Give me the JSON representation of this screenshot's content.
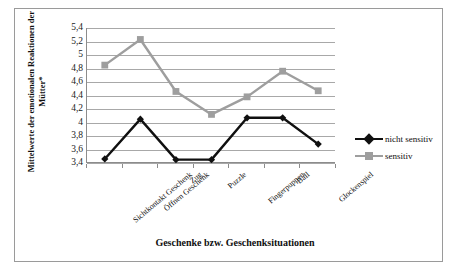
{
  "chart_data": {
    "type": "line",
    "title": "",
    "xlabel": "Geschenke bzw. Geschenksituationen",
    "ylabel_line1": "Mittelwerte der emotionalen Reaktionen der",
    "ylabel_line2": "Mütter*",
    "categories": [
      "Sichtkontakt Geschenk",
      "Öffnen Geschenk",
      "Zug",
      "Puzzle",
      "Fingerpuppen",
      "Ball",
      "Glockenspiel"
    ],
    "ylim": [
      3.4,
      5.4
    ],
    "ytick_labels": [
      "5,4",
      "5,2",
      "5",
      "4,8",
      "4,6",
      "4,4",
      "4,2",
      "4",
      "3,8",
      "3,6",
      "3,4"
    ],
    "ytick_values": [
      5.4,
      5.2,
      5.0,
      4.8,
      4.6,
      4.4,
      4.2,
      4.0,
      3.8,
      3.6,
      3.4
    ],
    "grid": true,
    "legend_position": "right",
    "series": [
      {
        "name": "nicht sensitiv",
        "values": [
          3.46,
          4.05,
          3.45,
          3.45,
          4.07,
          4.07,
          3.68
        ],
        "color": "#101010",
        "marker": "diamond"
      },
      {
        "name": "sensitiv",
        "values": [
          4.85,
          5.23,
          4.46,
          4.12,
          4.38,
          4.76,
          4.47
        ],
        "color": "#9e9e9e",
        "marker": "square"
      }
    ]
  },
  "legend": {
    "items": [
      {
        "label": "nicht sensitiv"
      },
      {
        "label": "sensitiv"
      }
    ]
  },
  "colors": {
    "series_nicht_sensitiv": "#101010",
    "series_sensitiv": "#9e9e9e",
    "gridline": "#a8a8a8",
    "frame": "#9a9a9a",
    "axis": "#8c8c8c"
  }
}
